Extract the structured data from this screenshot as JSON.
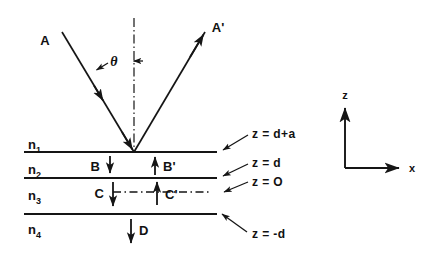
{
  "figure": {
    "background_color": "#ffffff",
    "ink_color": "#151515"
  },
  "rays": {
    "incident": {
      "label": "A",
      "description": "incident ray"
    },
    "reflected": {
      "label": "A'",
      "description": "reflected ray"
    },
    "angle": {
      "label": "θ",
      "description": "angle of incidence from normal"
    },
    "normal": {
      "label": "",
      "description": "dash-dot surface normal"
    }
  },
  "media": [
    {
      "label": "n",
      "subscript": "1"
    },
    {
      "label": "n",
      "subscript": "2"
    },
    {
      "label": "n",
      "subscript": "3"
    },
    {
      "label": "n",
      "subscript": "4"
    }
  ],
  "waves": [
    {
      "label": "B",
      "direction": "down",
      "layer": "n2"
    },
    {
      "label": "B'",
      "direction": "up",
      "layer": "n2"
    },
    {
      "label": "C",
      "direction": "down",
      "layer": "n3"
    },
    {
      "label": "C'",
      "direction": "up",
      "layer": "n3"
    },
    {
      "label": "D",
      "direction": "down",
      "layer": "n4"
    }
  ],
  "boundaries": [
    {
      "label": "z = d+a"
    },
    {
      "label": "z = d"
    },
    {
      "label": "z = O"
    },
    {
      "label": "z = -d"
    }
  ],
  "axes": {
    "vertical": "z",
    "horizontal": "x"
  }
}
